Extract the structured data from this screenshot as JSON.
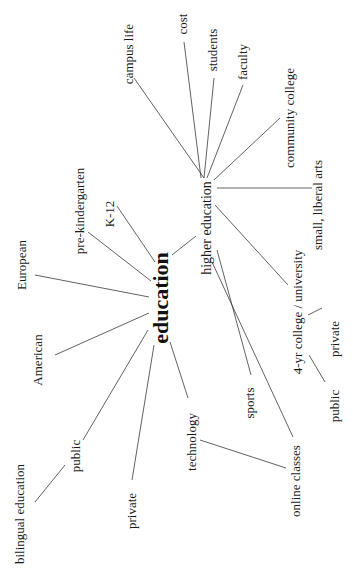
{
  "diagram": {
    "type": "mind-map",
    "orientation": "rotated-90-ccw",
    "center": {
      "label": "education"
    },
    "nodes": {
      "higher_education": "higher education",
      "campus_life": "campus life",
      "cost": "cost",
      "students": "students",
      "faculty": "faculty",
      "community_college": "community college",
      "small_liberal_arts": "small, liberal arts",
      "four_yr": "4-yr college / university",
      "four_yr_private": "private",
      "four_yr_public": "public",
      "sports": "sports",
      "online_classes": "online classes",
      "k12": "K-12",
      "pre_k": "pre-kindergarten",
      "european": "European",
      "american": "American",
      "public": "public",
      "bilingual": "bilingual education",
      "private": "private",
      "technology": "technology"
    },
    "edges": [
      [
        "education",
        "higher education"
      ],
      [
        "education",
        "K-12"
      ],
      [
        "education",
        "pre-kindergarten"
      ],
      [
        "education",
        "European"
      ],
      [
        "education",
        "American"
      ],
      [
        "education",
        "public"
      ],
      [
        "education",
        "private"
      ],
      [
        "education",
        "technology"
      ],
      [
        "higher education",
        "campus life"
      ],
      [
        "higher education",
        "cost"
      ],
      [
        "higher education",
        "students"
      ],
      [
        "higher education",
        "faculty"
      ],
      [
        "higher education",
        "community college"
      ],
      [
        "higher education",
        "small, liberal arts"
      ],
      [
        "higher education",
        "4-yr college / university"
      ],
      [
        "higher education",
        "sports"
      ],
      [
        "higher education",
        "online classes"
      ],
      [
        "4-yr college / university",
        "private"
      ],
      [
        "4-yr college / university",
        "public"
      ],
      [
        "public",
        "bilingual education"
      ],
      [
        "technology",
        "online classes"
      ]
    ]
  }
}
